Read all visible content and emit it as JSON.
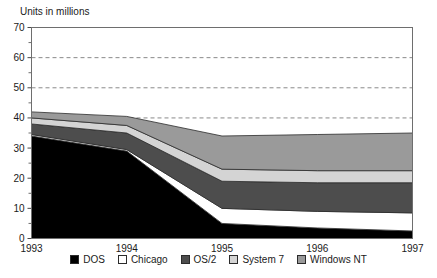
{
  "chart_data": {
    "type": "area",
    "stacked": true,
    "title": "",
    "ylabel": "Units in millions",
    "xlabel": "",
    "categories": [
      "1993",
      "1994",
      "1995",
      "1996",
      "1997"
    ],
    "x": [
      1993,
      1994,
      1995,
      1996,
      1997
    ],
    "ylim": [
      0,
      70
    ],
    "ytick_values": [
      0,
      10,
      20,
      30,
      40,
      50,
      60,
      70
    ],
    "ytick_labels": [
      "0",
      "10",
      "20",
      "30",
      "40",
      "50",
      "60",
      "70"
    ],
    "minor_ytick_values": [
      5,
      15,
      25,
      35,
      45,
      55,
      65
    ],
    "grid": "horizontal dashed at major y ticks",
    "legend_position": "bottom-center",
    "series": [
      {
        "name": "DOS",
        "color": "#000000",
        "values": [
          34.0,
          29.0,
          5.0,
          3.5,
          2.5
        ]
      },
      {
        "name": "Chicago",
        "color": "#ffffff",
        "values": [
          0.5,
          0.5,
          5.0,
          5.5,
          6.0
        ]
      },
      {
        "name": "OS/2",
        "color": "#4d4d4d",
        "values": [
          3.5,
          5.5,
          9.0,
          9.5,
          10.0
        ]
      },
      {
        "name": "System 7",
        "color": "#d4d4d4",
        "values": [
          2.0,
          2.5,
          4.0,
          4.0,
          4.0
        ]
      },
      {
        "name": "Windows NT",
        "color": "#9a9a9a",
        "values": [
          2.0,
          3.0,
          11.0,
          12.0,
          12.5
        ]
      }
    ],
    "cumulative_tops": {
      "DOS": [
        34.0,
        29.0,
        5.0,
        3.5,
        2.5
      ],
      "Chicago": [
        34.5,
        29.5,
        10.0,
        9.0,
        8.5
      ],
      "OS/2": [
        38.0,
        35.0,
        19.0,
        18.5,
        18.5
      ],
      "System 7": [
        40.0,
        37.5,
        23.0,
        22.5,
        22.5
      ],
      "Windows NT": [
        42.0,
        40.5,
        34.0,
        34.5,
        35.0
      ]
    }
  },
  "legend": {
    "items": [
      {
        "label": "DOS",
        "color": "#000000"
      },
      {
        "label": "Chicago",
        "color": "#ffffff"
      },
      {
        "label": "OS/2",
        "color": "#4d4d4d"
      },
      {
        "label": "System 7",
        "color": "#d4d4d4"
      },
      {
        "label": "Windows NT",
        "color": "#9a9a9a"
      }
    ]
  }
}
